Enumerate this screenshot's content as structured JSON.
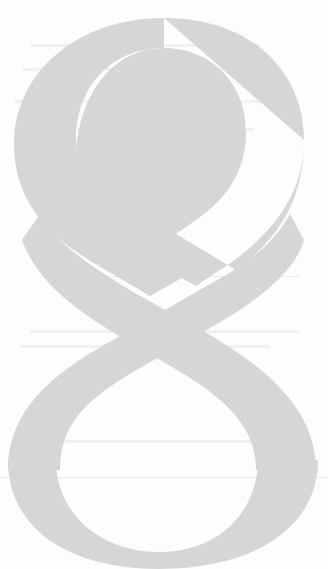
{
  "page": {
    "type": "chapter-opener",
    "chapter_numeral": "8",
    "numeral_color": "#d6d6d6",
    "background_color": "#fdfdfd"
  }
}
